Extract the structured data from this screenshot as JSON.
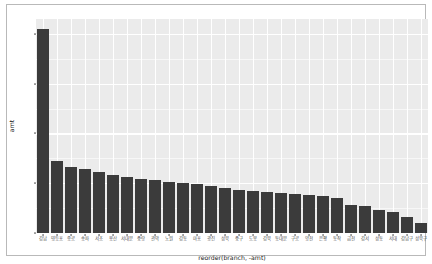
{
  "chart_data": {
    "type": "bar",
    "title": "",
    "xlabel": "reorder(branch, -amt)",
    "ylabel": "amt",
    "ylim": [
      0,
      4300
    ],
    "grid": true,
    "legend": "none",
    "bar_color": "#3b3b3b",
    "panel_background": "#ebebeb",
    "gridline_color": "#ffffff",
    "ytick_labels": [
      "0",
      "1000",
      "2000",
      "3000",
      "4000"
    ],
    "ytick_values": [
      0,
      1000,
      2000,
      3000,
      4000
    ],
    "categories": [
      "강남",
      "영등포",
      "종로",
      "송파",
      "서초",
      "용산",
      "서대문",
      "중랑",
      "관악",
      "노원",
      "강동",
      "마포",
      "광진",
      "성북",
      "중구",
      "도봉",
      "강북",
      "동대문",
      "구로",
      "양천",
      "은평",
      "동작",
      "금천",
      "강서",
      "성동",
      "서대",
      "강남구",
      "성북구"
    ],
    "values": [
      4100,
      1455,
      1330,
      1290,
      1225,
      1160,
      1120,
      1095,
      1060,
      1030,
      1000,
      975,
      940,
      905,
      870,
      845,
      820,
      800,
      780,
      760,
      735,
      705,
      560,
      545,
      460,
      420,
      330,
      200
    ]
  },
  "axes": {
    "y_title": "amt",
    "x_title": "reorder(branch, -amt)"
  }
}
